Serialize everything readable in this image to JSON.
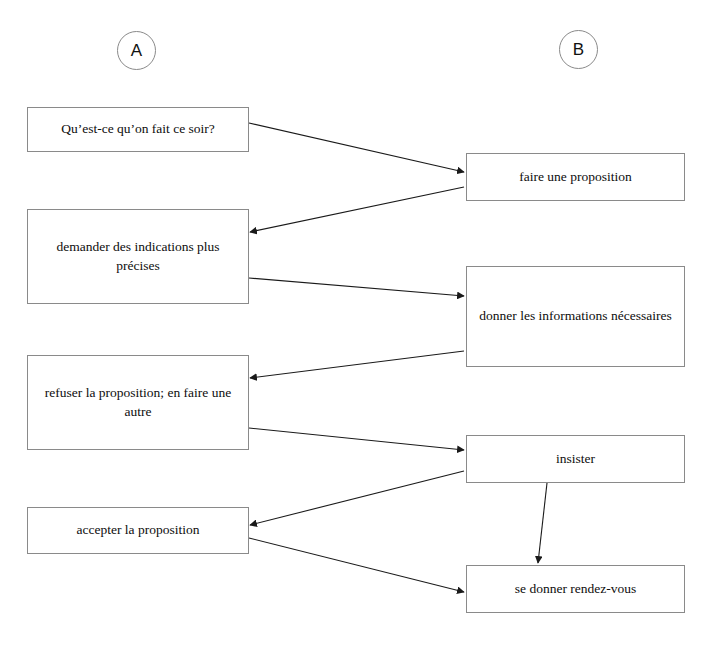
{
  "diagram": {
    "title_absent": true,
    "columns": [
      {
        "id": "A",
        "label": "A"
      },
      {
        "id": "B",
        "label": "B"
      }
    ],
    "column_a_nodes": [
      {
        "id": "a1",
        "label": "Qu’est-ce qu’on fait ce soir?"
      },
      {
        "id": "a2",
        "label": "demander des indications plus précises"
      },
      {
        "id": "a3",
        "label": "refuser la proposition; en faire une autre"
      },
      {
        "id": "a4",
        "label": "accepter la proposition"
      }
    ],
    "column_b_nodes": [
      {
        "id": "b1",
        "label": "faire une proposition"
      },
      {
        "id": "b2",
        "label": "donner les informations nécessaires"
      },
      {
        "id": "b3",
        "label": "insister"
      },
      {
        "id": "b4",
        "label": "se donner rendez-vous"
      }
    ],
    "edges": [
      {
        "from": "a1",
        "to": "b1",
        "direction": "a-to-b"
      },
      {
        "from": "b1",
        "to": "a2",
        "direction": "b-to-a"
      },
      {
        "from": "a2",
        "to": "b2",
        "direction": "a-to-b"
      },
      {
        "from": "b2",
        "to": "a3",
        "direction": "b-to-a"
      },
      {
        "from": "a3",
        "to": "b3",
        "direction": "a-to-b"
      },
      {
        "from": "b3",
        "to": "a4",
        "direction": "b-to-a"
      },
      {
        "from": "a4",
        "to": "b4",
        "direction": "a-to-b"
      },
      {
        "from": "b3",
        "to": "b4",
        "direction": "b-to-b"
      }
    ],
    "colors": {
      "box_border": "#8a8a8a",
      "edge_line": "#1a1a1a",
      "text": "#0d0d0d",
      "background": "#ffffff"
    }
  }
}
